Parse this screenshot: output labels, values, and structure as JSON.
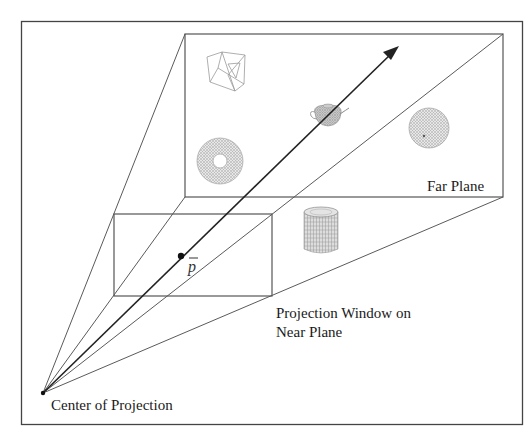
{
  "diagram": {
    "labels": {
      "far_plane": "Far Plane",
      "near_window_line1": "Projection Window on",
      "near_window_line2": "Near Plane",
      "center_of_projection": "Center of Projection",
      "point": "p"
    },
    "colors": {
      "background": "#ffffff",
      "frame": "#444444",
      "lines": "#555555",
      "arrow": "#222222",
      "objects": "#9a9a9a",
      "text": "#1a1a1a"
    },
    "geometry": {
      "outer_frame": {
        "x": 21,
        "y": 21,
        "w": 501,
        "h": 403
      },
      "far_plane": {
        "x": 185,
        "y": 34,
        "w": 318,
        "h": 163
      },
      "near_window": {
        "x": 114,
        "y": 214,
        "w": 158,
        "h": 82
      },
      "center_of_projection": {
        "x": 43,
        "y": 393
      },
      "point_p": {
        "x": 181,
        "y": 256
      },
      "arrow_tip": {
        "x": 399,
        "y": 46
      }
    },
    "objects": [
      {
        "name": "wireframe-cube",
        "x": 220,
        "y": 66
      },
      {
        "name": "teapot",
        "x": 328,
        "y": 116
      },
      {
        "name": "sphere",
        "x": 429,
        "y": 128
      },
      {
        "name": "torus",
        "x": 220,
        "y": 161
      },
      {
        "name": "cylinder",
        "x": 321,
        "y": 230
      }
    ]
  }
}
